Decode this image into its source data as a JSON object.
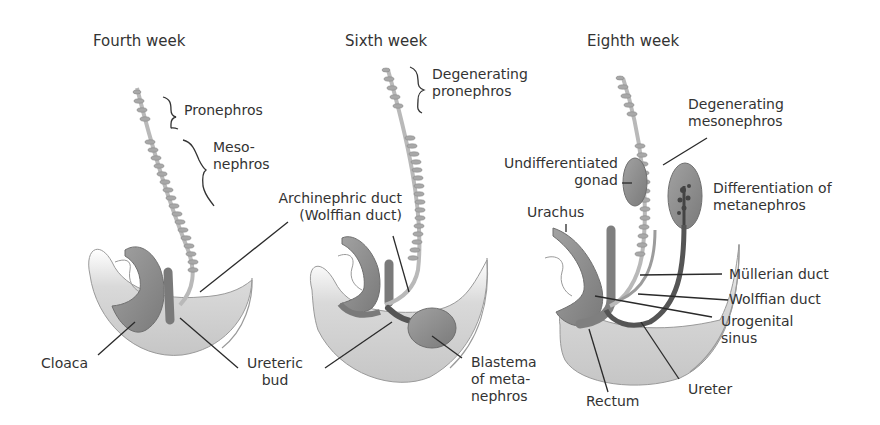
{
  "panels": [
    {
      "title": "Fourth week",
      "labels": {
        "pronephros": "Pronephros",
        "mesonephros_1": "Meso-",
        "mesonephros_2": "nephros",
        "cloaca": "Cloaca",
        "ureteric_bud_1": "Ureteric",
        "ureteric_bud_2": "bud"
      }
    },
    {
      "title": "Sixth week",
      "labels": {
        "degenerating_pronephros_1": "Degenerating",
        "degenerating_pronephros_2": "pronephros",
        "archinephric_duct_1": "Archinephric duct",
        "archinephric_duct_2": "(Wolffian duct)",
        "blastema_1": "Blastema",
        "blastema_2": "of meta-",
        "blastema_3": "nephros"
      }
    },
    {
      "title": "Eighth week",
      "labels": {
        "degenerating_mesonephros_1": "Degenerating",
        "degenerating_mesonephros_2": "mesonephros",
        "undifferentiated_gonad_1": "Undifferentiated",
        "undifferentiated_gonad_2": "gonad",
        "differentiation_1": "Differentiation of",
        "differentiation_2": "metanephros",
        "urachus": "Urachus",
        "mullerian_duct": "Müllerian duct",
        "wolffian_duct": "Wolffian duct",
        "urogenital_sinus_1": "Urogenital",
        "urogenital_sinus_2": "sinus",
        "ureter": "Ureter",
        "rectum": "Rectum"
      }
    }
  ],
  "colors": {
    "tissue": "#c8c8c8",
    "organ": "#8f8f8f",
    "organ_dark": "#6a6a6a",
    "duct_dark": "#555555",
    "leader": "#2a2a2a",
    "text": "#333333"
  }
}
